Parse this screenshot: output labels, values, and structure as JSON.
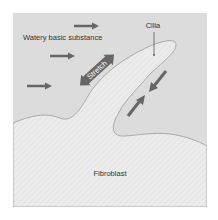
{
  "diagram": {
    "labels": {
      "medium": "Watery basic substance",
      "cilia": "Cilia",
      "cell": "Fibroblast",
      "stretch": "Stretch"
    },
    "colors": {
      "background": "#ffffff",
      "medium_fill": "#dcdcdc",
      "cell_fill": "#ececec",
      "cell_stripe": "#e2e2e2",
      "outline": "#9a9a9a",
      "arrow": "#666666",
      "text": "#333333",
      "stretch_text": "#ffffff"
    },
    "icons": [
      "flow-arrow",
      "flow-arrow",
      "flow-arrow",
      "stretch-double-arrow",
      "compression-arrow",
      "compression-arrow",
      "leader-line"
    ]
  }
}
